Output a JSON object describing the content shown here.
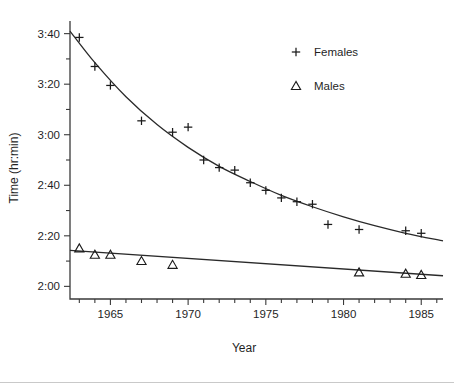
{
  "chart_data": {
    "type": "scatter",
    "title": "",
    "xlabel": "Year",
    "ylabel": "Time (hr:min)",
    "xlim": [
      1962.4,
      1986.4
    ],
    "ylim": [
      115,
      225
    ],
    "grid": false,
    "legend_position": "top-right",
    "y_tick_labels": [
      "2:00",
      "2:20",
      "2:40",
      "3:00",
      "3:20",
      "3:40"
    ],
    "y_tick_values": [
      120,
      140,
      160,
      180,
      200,
      220
    ],
    "y_minor_step_minutes": 10,
    "x_tick_labels": [
      "1965",
      "1970",
      "1975",
      "1980",
      "1985"
    ],
    "x_tick_values": [
      1965,
      1970,
      1975,
      1980,
      1985
    ],
    "x_minor_step_years": 1,
    "series": [
      {
        "name": "Females",
        "marker": "plus",
        "x": [
          1963,
          1964,
          1965,
          1967,
          1969,
          1970,
          1971,
          1972,
          1973,
          1974,
          1975,
          1976,
          1977,
          1978,
          1979,
          1981,
          1984,
          1985
        ],
        "y": [
          218.5,
          207.0,
          199.5,
          185.5,
          181.0,
          183.0,
          170.0,
          167.0,
          166.0,
          161.0,
          158.0,
          155.0,
          153.5,
          152.5,
          144.5,
          142.5,
          142.0,
          141.0
        ],
        "y_labels": [
          "3:38.5",
          "3:27",
          "3:19.5",
          "3:05.5",
          "3:01",
          "3:03",
          "2:50",
          "2:47",
          "2:46",
          "2:41",
          "2:38",
          "2:35",
          "2:33.5",
          "2:32.5",
          "2:24.5",
          "2:22.5",
          "2:22",
          "2:21"
        ]
      },
      {
        "name": "Males",
        "marker": "triangle",
        "x": [
          1963,
          1964,
          1965,
          1967,
          1969,
          1981,
          1984,
          1985
        ],
        "y": [
          135.0,
          132.5,
          132.5,
          130.0,
          128.5,
          125.5,
          125.0,
          124.5
        ],
        "y_labels": [
          "2:15",
          "2:12.5",
          "2:12.5",
          "2:10",
          "2:08.5",
          "2:05.5",
          "2:05",
          "2:04.5"
        ]
      }
    ],
    "fit_lines": [
      {
        "name": "Females fit",
        "type": "exponential-decay",
        "x": [
          1962.4,
          1964,
          1966,
          1968,
          1970,
          1972,
          1974,
          1976,
          1978,
          1980,
          1982,
          1984,
          1986.4
        ],
        "y": [
          221.0,
          208.5,
          195.0,
          184.0,
          175.0,
          167.5,
          161.5,
          156.0,
          151.5,
          147.5,
          144.0,
          141.0,
          138.0
        ]
      },
      {
        "name": "Males fit",
        "type": "linear",
        "x": [
          1962.4,
          1986.4
        ],
        "y": [
          134.2,
          124.2
        ]
      }
    ]
  },
  "legend": {
    "items": [
      {
        "label": "Females",
        "marker": "plus"
      },
      {
        "label": "Males",
        "marker": "triangle"
      }
    ]
  },
  "colors": {
    "axis": "#3a3a3a",
    "curve": "#2a2a2a",
    "marker": "#1a1a1a",
    "text": "#1f1f1f",
    "background": "#ffffff"
  }
}
